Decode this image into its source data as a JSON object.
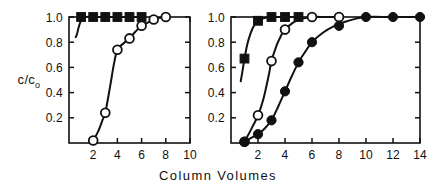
{
  "figure": {
    "background": "#ffffff",
    "ink": "#111111",
    "axis_label_x": "Column Volumes",
    "axis_label_y_numerator": "c/c",
    "axis_label_y_subscript": "o"
  },
  "chart_data": [
    {
      "type": "line",
      "panel": "left",
      "title": "",
      "xlabel": "Column Volumes",
      "ylabel": "c/co",
      "xlim": [
        0,
        10
      ],
      "ylim": [
        0,
        1.0
      ],
      "xticks": [
        2,
        4,
        6,
        8,
        10
      ],
      "xticklabels": [
        "2",
        "4",
        "6",
        "8",
        "10"
      ],
      "yticks": [
        0.2,
        0.4,
        0.6,
        0.8,
        1.0
      ],
      "yticklabels": [
        "0.2",
        "0.4",
        "0.6",
        "0.8",
        "1.0"
      ],
      "grid": false,
      "legend": "none",
      "series": [
        {
          "name": "filled-squares",
          "marker": "filled-square",
          "x": [
            1,
            2,
            3,
            4,
            5,
            6
          ],
          "values": [
            1.0,
            1.0,
            1.0,
            1.0,
            1.0,
            1.0
          ],
          "curve_x": [
            0.55,
            0.65,
            0.75,
            0.9,
            1.1,
            1.4,
            2,
            3,
            4,
            5,
            6
          ],
          "curve_y": [
            0.84,
            0.86,
            0.9,
            0.95,
            0.985,
            1.0,
            1.0,
            1.0,
            1.0,
            1.0,
            1.0
          ]
        },
        {
          "name": "open-circles",
          "marker": "open-circle",
          "x": [
            2,
            3,
            4,
            5,
            6,
            7,
            8
          ],
          "values": [
            0.02,
            0.24,
            0.74,
            0.83,
            0.93,
            0.98,
            1.0
          ],
          "curve_x": [
            1.85,
            2,
            2.4,
            2.8,
            3,
            3.4,
            3.7,
            4,
            4.5,
            5,
            5.5,
            6,
            6.5,
            7,
            7.5,
            8
          ],
          "curve_y": [
            0.0,
            0.02,
            0.09,
            0.19,
            0.24,
            0.45,
            0.62,
            0.74,
            0.79,
            0.83,
            0.885,
            0.93,
            0.955,
            0.98,
            0.993,
            1.0
          ]
        }
      ]
    },
    {
      "type": "line",
      "panel": "right",
      "title": "",
      "xlabel": "Column Volumes",
      "ylabel": "c/co",
      "xlim": [
        0,
        14
      ],
      "ylim": [
        0,
        1.0
      ],
      "xticks": [
        2,
        4,
        6,
        8,
        10,
        12,
        14
      ],
      "xticklabels": [
        "2",
        "4",
        "6",
        "8",
        "10",
        "12",
        "14"
      ],
      "yticks": [
        0.2,
        0.4,
        0.6,
        0.8,
        1.0
      ],
      "yticklabels": [
        "0.2",
        "0.4",
        "0.6",
        "0.8",
        "1.0"
      ],
      "grid": false,
      "legend": "none",
      "series": [
        {
          "name": "filled-squares",
          "marker": "filled-square",
          "x": [
            1,
            2,
            3,
            4,
            5
          ],
          "values": [
            0.67,
            0.97,
            1.0,
            1.0,
            1.0
          ],
          "curve_x": [
            0.72,
            0.85,
            1.0,
            1.2,
            1.45,
            1.7,
            2.0,
            2.4,
            3.0,
            4.0,
            5.0
          ],
          "curve_y": [
            0.49,
            0.57,
            0.67,
            0.78,
            0.87,
            0.93,
            0.97,
            0.99,
            1.0,
            1.0,
            1.0
          ]
        },
        {
          "name": "open-circles",
          "marker": "open-circle",
          "x": [
            1,
            2,
            3,
            4,
            6,
            8
          ],
          "values": [
            0.01,
            0.22,
            0.65,
            0.9,
            1.0,
            1.0
          ],
          "curve_x": [
            0.95,
            1.2,
            1.5,
            2.0,
            2.4,
            2.8,
            3.0,
            3.4,
            3.7,
            4.0,
            4.6,
            5.2,
            6.0,
            7.0,
            8.0
          ],
          "curve_y": [
            0.01,
            0.05,
            0.11,
            0.22,
            0.35,
            0.54,
            0.65,
            0.78,
            0.85,
            0.9,
            0.955,
            0.985,
            1.0,
            1.0,
            1.0
          ]
        },
        {
          "name": "filled-circles",
          "marker": "filled-circle",
          "x": [
            1,
            2,
            3,
            4,
            5,
            6,
            8,
            10,
            12,
            14
          ],
          "values": [
            0.01,
            0.07,
            0.18,
            0.41,
            0.64,
            0.8,
            0.93,
            1.0,
            1.0,
            1.0
          ],
          "curve_x": [
            0.95,
            1.4,
            2.0,
            2.5,
            3.0,
            3.5,
            4.0,
            4.5,
            5.0,
            5.5,
            6.0,
            6.8,
            7.6,
            8.4,
            9.2,
            10.0,
            12.0,
            14.0
          ],
          "curve_y": [
            0.01,
            0.035,
            0.07,
            0.115,
            0.18,
            0.29,
            0.41,
            0.53,
            0.64,
            0.725,
            0.8,
            0.875,
            0.925,
            0.96,
            0.985,
            1.0,
            1.0,
            1.0
          ]
        }
      ]
    }
  ]
}
